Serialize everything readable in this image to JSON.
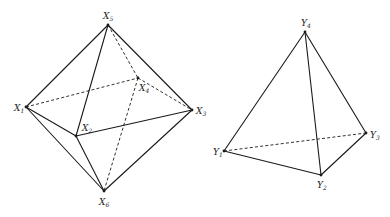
{
  "figures": [
    {
      "name": "octahedron",
      "vertices": [
        {
          "id": "X1",
          "letter": "X",
          "sub": "1",
          "x": 26,
          "y": 107,
          "lx": 14,
          "ly": 111
        },
        {
          "id": "X2",
          "letter": "X",
          "sub": "2",
          "x": 76,
          "y": 136,
          "lx": 82,
          "ly": 131
        },
        {
          "id": "X3",
          "letter": "X",
          "sub": "3",
          "x": 192,
          "y": 110,
          "lx": 196,
          "ly": 114
        },
        {
          "id": "X4",
          "letter": "X",
          "sub": "4",
          "x": 138,
          "y": 78,
          "lx": 139,
          "ly": 91
        },
        {
          "id": "X5",
          "letter": "X",
          "sub": "5",
          "x": 108,
          "y": 25,
          "lx": 103,
          "ly": 19
        },
        {
          "id": "X6",
          "letter": "X",
          "sub": "6",
          "x": 104,
          "y": 191,
          "lx": 99,
          "ly": 205
        }
      ],
      "solid_edges": [
        [
          "X5",
          "X1"
        ],
        [
          "X5",
          "X2"
        ],
        [
          "X5",
          "X3"
        ],
        [
          "X1",
          "X2"
        ],
        [
          "X2",
          "X3"
        ],
        [
          "X1",
          "X6"
        ],
        [
          "X2",
          "X6"
        ],
        [
          "X3",
          "X6"
        ]
      ],
      "dashed_edges": [
        [
          "X5",
          "X4"
        ],
        [
          "X1",
          "X4"
        ],
        [
          "X4",
          "X3"
        ],
        [
          "X4",
          "X6"
        ]
      ]
    },
    {
      "name": "tetrahedron",
      "vertices": [
        {
          "id": "Y1",
          "letter": "Y",
          "sub": "1",
          "x": 224,
          "y": 151,
          "lx": 213,
          "ly": 155
        },
        {
          "id": "Y2",
          "letter": "Y",
          "sub": "2",
          "x": 321,
          "y": 175,
          "lx": 317,
          "ly": 188
        },
        {
          "id": "Y3",
          "letter": "Y",
          "sub": "3",
          "x": 366,
          "y": 133,
          "lx": 370,
          "ly": 138
        },
        {
          "id": "Y4",
          "letter": "Y",
          "sub": "4",
          "x": 305,
          "y": 32,
          "lx": 301,
          "ly": 26
        }
      ],
      "solid_edges": [
        [
          "Y4",
          "Y1"
        ],
        [
          "Y4",
          "Y2"
        ],
        [
          "Y4",
          "Y3"
        ],
        [
          "Y1",
          "Y2"
        ],
        [
          "Y2",
          "Y3"
        ]
      ],
      "dashed_edges": [
        [
          "Y1",
          "Y3"
        ]
      ]
    }
  ]
}
